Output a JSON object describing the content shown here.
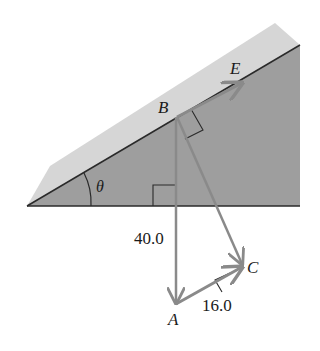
{
  "diagram": {
    "type": "inclined-plane-vector-diagram",
    "points": {
      "A": {
        "label": "A"
      },
      "B": {
        "label": "B"
      },
      "C": {
        "label": "C"
      },
      "E": {
        "label": "E"
      }
    },
    "angle_label": "θ",
    "lengths": {
      "BA": "40.0",
      "AC": "16.0"
    },
    "colors": {
      "background": "#ffffff",
      "incline_surface": "#d6d6d6",
      "incline_side": "#9e9e9e",
      "vector": "#8a8a8a",
      "edge": "#2a2a2a",
      "text": "#1a1a1a"
    }
  }
}
